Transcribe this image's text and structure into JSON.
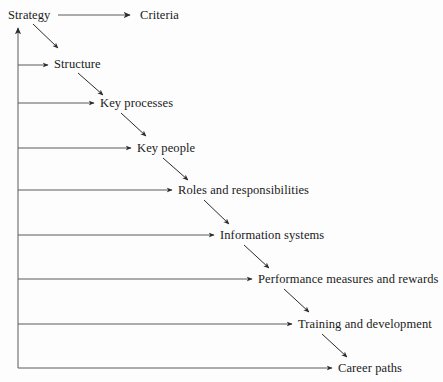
{
  "diagram": {
    "title": "",
    "type": "cascade-flow-diagram",
    "colors": {
      "background": "#fdfdfd",
      "line": "#5a5a5e",
      "arrow": "#2b2b2b",
      "text": "#1a1a1a"
    },
    "spine": {
      "name": "vertical-feedback-arrow",
      "description": "vertical line on left with upward arrowhead",
      "x": 18,
      "y_top": 28,
      "y_bottom": 368
    },
    "source_node": {
      "label": "Strategy",
      "x": 8,
      "y": 19
    },
    "criteria_node": {
      "label": "Criteria",
      "x": 140,
      "y": 19
    },
    "nodes": [
      {
        "label": "Structure",
        "x": 54,
        "y": 68,
        "branch_y": 65,
        "branch_end": 48
      },
      {
        "label": "Key processes",
        "x": 100,
        "y": 107,
        "branch_y": 103,
        "branch_end": 94
      },
      {
        "label": "Key people",
        "x": 137,
        "y": 152,
        "branch_y": 148,
        "branch_end": 131
      },
      {
        "label": "Roles and responsibilities",
        "x": 178,
        "y": 194,
        "branch_y": 190,
        "branch_end": 172
      },
      {
        "label": "Information systems",
        "x": 220,
        "y": 239,
        "branch_y": 235,
        "branch_end": 214
      },
      {
        "label": "Performance measures and rewards",
        "x": 258,
        "y": 283,
        "branch_y": 279,
        "branch_end": 252
      },
      {
        "label": "Training and development",
        "x": 298,
        "y": 328,
        "branch_y": 324,
        "branch_end": 292
      },
      {
        "label": "Career paths",
        "x": 338,
        "y": 372,
        "branch_y": 368,
        "branch_end": 332
      }
    ],
    "diagonals": [
      {
        "from": "Strategy",
        "to": "Structure",
        "x1": 33,
        "y1": 24,
        "x2": 58,
        "y2": 48
      },
      {
        "from": "Structure",
        "to": "Key processes",
        "x1": 78,
        "y1": 73,
        "x2": 103,
        "y2": 95
      },
      {
        "from": "Key processes",
        "to": "Key people",
        "x1": 121,
        "y1": 113,
        "x2": 146,
        "y2": 136
      },
      {
        "from": "Key people",
        "to": "Roles and responsibilities",
        "x1": 163,
        "y1": 158,
        "x2": 188,
        "y2": 180
      },
      {
        "from": "Roles and responsibilities",
        "to": "Information systems",
        "x1": 204,
        "y1": 200,
        "x2": 229,
        "y2": 224
      },
      {
        "from": "Information systems",
        "to": "Performance measures and rewards",
        "x1": 244,
        "y1": 245,
        "x2": 269,
        "y2": 268
      },
      {
        "from": "Performance measures and rewards",
        "to": "Training and development",
        "x1": 284,
        "y1": 289,
        "x2": 309,
        "y2": 312
      },
      {
        "from": "Training and development",
        "to": "Career paths",
        "x1": 322,
        "y1": 334,
        "x2": 347,
        "y2": 357
      }
    ],
    "top_arrow": {
      "name": "strategy-to-criteria-arrow",
      "x1": 58,
      "y1": 15,
      "x2": 130,
      "y2": 15
    }
  }
}
